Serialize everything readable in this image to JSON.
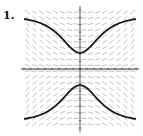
{
  "figure": {
    "label": "1."
  },
  "chart_data": {
    "type": "line",
    "title": "",
    "subtitle": "Slope field with two solution curves",
    "xlabel": "",
    "ylabel": "",
    "xlim": [
      -4,
      4
    ],
    "ylim": [
      -4,
      4
    ],
    "grid": false,
    "legend": null,
    "slope_field": true,
    "series": [
      {
        "name": "upper solution curve",
        "x": [
          -4,
          -3,
          -2,
          -1.5,
          -1,
          -0.5,
          0,
          0.5,
          1,
          1.5,
          2,
          3,
          4
        ],
        "y": [
          3.5,
          3.3,
          2.6,
          2.1,
          1.6,
          1.2,
          1.1,
          1.2,
          1.6,
          2.1,
          2.6,
          3.3,
          3.5
        ]
      },
      {
        "name": "lower solution curve",
        "x": [
          -4,
          -3,
          -2,
          -1.5,
          -1,
          -0.5,
          0,
          0.5,
          1,
          1.5,
          2,
          3,
          4
        ],
        "y": [
          -3.5,
          -3.3,
          -2.6,
          -2.1,
          -1.6,
          -1.2,
          -1.1,
          -1.2,
          -1.6,
          -2.1,
          -2.6,
          -3.3,
          -3.5
        ]
      }
    ],
    "colors": {
      "curve": "#1a1a1a",
      "field": "#9a9a9a",
      "axis": "#333333"
    }
  }
}
